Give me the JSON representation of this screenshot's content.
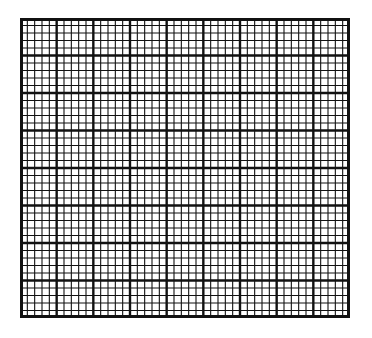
{
  "grid": {
    "left": 20,
    "top": 18,
    "width": 330,
    "height": 300,
    "major_columns": 9,
    "major_rows": 8,
    "subdivisions": 5,
    "line_color": "#111111",
    "background": "#ffffff",
    "major_stroke": 2.4,
    "minor_stroke": 1.1,
    "border_stroke": 3
  }
}
